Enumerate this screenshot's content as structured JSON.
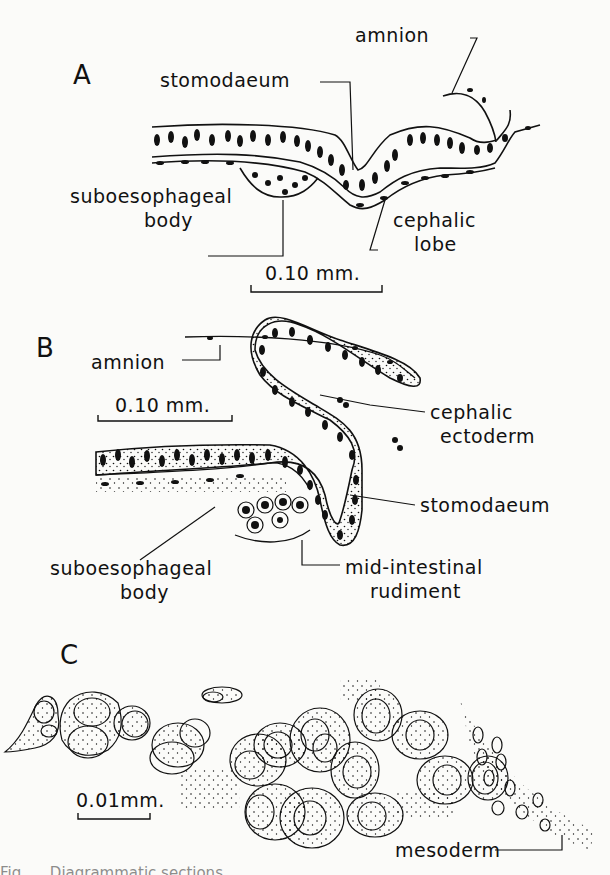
{
  "figure": {
    "panels": [
      {
        "id": "A",
        "letter": "A",
        "labels": {
          "amnion": "amnion",
          "stomodaeum": "stomodaeum",
          "suboesophageal_1": "suboesophageal",
          "suboesophageal_2": "body",
          "cephalic_1": "cephalic",
          "cephalic_2": "lobe"
        },
        "scale_bar": "0.10 mm."
      },
      {
        "id": "B",
        "letter": "B",
        "labels": {
          "amnion": "amnion",
          "cephalic_1": "cephalic",
          "cephalic_2": "ectoderm",
          "stomodaeum": "stomodaeum",
          "suboesophageal_1": "suboesophageal",
          "suboesophageal_2": "body",
          "midintestinal_1": "mid-intestinal",
          "midintestinal_2": "rudiment"
        },
        "scale_bar": "0.10 mm."
      },
      {
        "id": "C",
        "letter": "C",
        "labels": {
          "mesoderm": "mesoderm"
        },
        "scale_bar": "0.01mm."
      }
    ],
    "caption_partial": "Fig. ... Diagrammatic sections ..."
  },
  "colors": {
    "ink": "#111111",
    "paper": "#fbfbf9"
  }
}
